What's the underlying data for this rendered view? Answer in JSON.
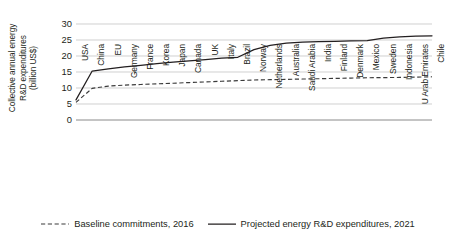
{
  "chart_data": {
    "type": "line",
    "title": "",
    "xlabel": "",
    "ylabel": "Collective annual energy\nR&D expenditures\n(billion US$)",
    "ylim": [
      0,
      30
    ],
    "yticks": [
      30,
      25,
      20,
      15,
      10,
      5,
      0
    ],
    "grid": true,
    "legend_position": "bottom",
    "categories": [
      "USA",
      "China",
      "EU",
      "Germany",
      "France",
      "Korea",
      "Japan",
      "Canada",
      "UK",
      "Italy",
      "Brazil",
      "Norway",
      "Netherlands",
      "Australia",
      "Saudi Arabia",
      "India",
      "Finland",
      "Denmark",
      "Mexico",
      "Sweden",
      "Indonesia",
      "U Arab Emirates",
      "Chile"
    ],
    "series": [
      {
        "name": "Baseline commitments, 2016",
        "style": "dashed",
        "color": "#3a3a3a",
        "values": [
          5.5,
          9.9,
          10.6,
          10.9,
          11.1,
          11.3,
          11.5,
          11.7,
          11.9,
          12.1,
          12.3,
          12.5,
          12.6,
          12.7,
          12.8,
          12.9,
          13.0,
          13.1,
          13.2,
          13.25,
          13.3,
          13.4,
          13.5
        ]
      },
      {
        "name": "Projected energy R&D expenditures, 2021",
        "style": "solid",
        "color": "#231f20",
        "values": [
          6.3,
          15.3,
          16.0,
          16.6,
          17.1,
          17.6,
          18.1,
          18.5,
          18.9,
          19.3,
          19.6,
          22.0,
          23.3,
          24.0,
          24.3,
          24.5,
          24.6,
          24.7,
          24.8,
          25.6,
          26.0,
          26.2,
          26.3
        ]
      }
    ]
  },
  "legend": {
    "items": [
      {
        "label": "Baseline commitments, 2016",
        "style": "dashed"
      },
      {
        "label": "Projected energy R&D expenditures, 2021",
        "style": "solid"
      }
    ]
  }
}
